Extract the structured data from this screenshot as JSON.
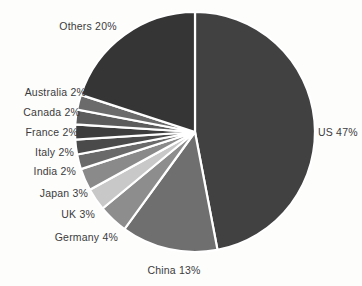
{
  "chart_data": {
    "type": "pie",
    "title": "",
    "subtitle": "",
    "xlabel": "",
    "ylabel": "",
    "legend_position": "none",
    "grid": false,
    "unit": "%",
    "categories": [
      "US",
      "China",
      "Germany",
      "UK",
      "Japan",
      "India",
      "Italy",
      "France",
      "Canada",
      "Australia",
      "Others"
    ],
    "values": [
      47,
      13,
      4,
      3,
      3,
      2,
      2,
      2,
      2,
      2,
      20
    ],
    "start_angle_deg": 0,
    "direction": "clockwise",
    "slices": [
      {
        "label": "US 47%",
        "name": "US",
        "value": 47,
        "color": "#414141"
      },
      {
        "label": "China 13%",
        "name": "China",
        "value": 13,
        "color": "#6f6f6f"
      },
      {
        "label": "Germany 4%",
        "name": "Germany",
        "value": 4,
        "color": "#8d8d8d"
      },
      {
        "label": "UK 3%",
        "name": "UK",
        "value": 3,
        "color": "#c8c8c8"
      },
      {
        "label": "Japan 3%",
        "name": "Japan",
        "value": 3,
        "color": "#8a8a8a"
      },
      {
        "label": "India 2%",
        "name": "India",
        "value": 2,
        "color": "#6a6a6a"
      },
      {
        "label": "Italy 2%",
        "name": "Italy",
        "value": 2,
        "color": "#4a4a4a"
      },
      {
        "label": "France 2%",
        "name": "France",
        "value": 2,
        "color": "#3d3d3d"
      },
      {
        "label": "Canada 2%",
        "name": "Canada",
        "value": 2,
        "color": "#5c5c5c"
      },
      {
        "label": "Australia 2%",
        "name": "Australia",
        "value": 2,
        "color": "#6b6b6b"
      },
      {
        "label": "Others 20%",
        "name": "Others",
        "value": 20,
        "color": "#353535"
      }
    ],
    "colors": {
      "background": "#fdfdfc",
      "slice_border": "#ffffff",
      "label_text": "#3b3b3b"
    }
  },
  "labels": {
    "us": "US 47%",
    "china": "China 13%",
    "germany": "Germany 4%",
    "uk": "UK 3%",
    "japan": "Japan 3%",
    "india": "India 2%",
    "italy": "Italy 2%",
    "france": "France 2%",
    "canada": "Canada 2%",
    "australia": "Australia 2%",
    "others": "Others 20%"
  }
}
